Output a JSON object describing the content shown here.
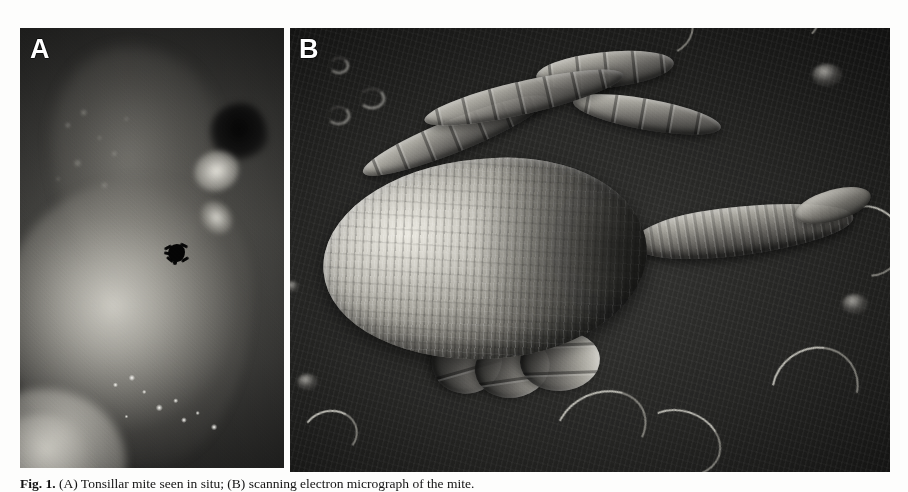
{
  "figure": {
    "panels": [
      {
        "id": "A",
        "label": "A",
        "kind": "clinical-photograph",
        "description": "Grayscale endoscopic view of tonsillar mucosa with a small dark mite attached near the centre of the tissue surface"
      },
      {
        "id": "B",
        "label": "B",
        "kind": "scanning-electron-micrograph",
        "description": "Scanning electron micrograph of the mite showing the striated oval idiosoma, segmented legs and anterior gnathosoma"
      }
    ],
    "caption": {
      "prefix": "Fig. 1.",
      "text": "(A) Tonsillar mite seen in situ; (B) scanning electron micrograph of the mite.",
      "full": "Fig. 1. (A) Tonsillar mite seen in situ; (B) scanning electron micrograph of the mite."
    }
  },
  "colors": {
    "page_background": "#fdfdfc",
    "panel_background": "#0a0a0a",
    "label_color": "#ffffff",
    "caption_color": "#121212"
  }
}
